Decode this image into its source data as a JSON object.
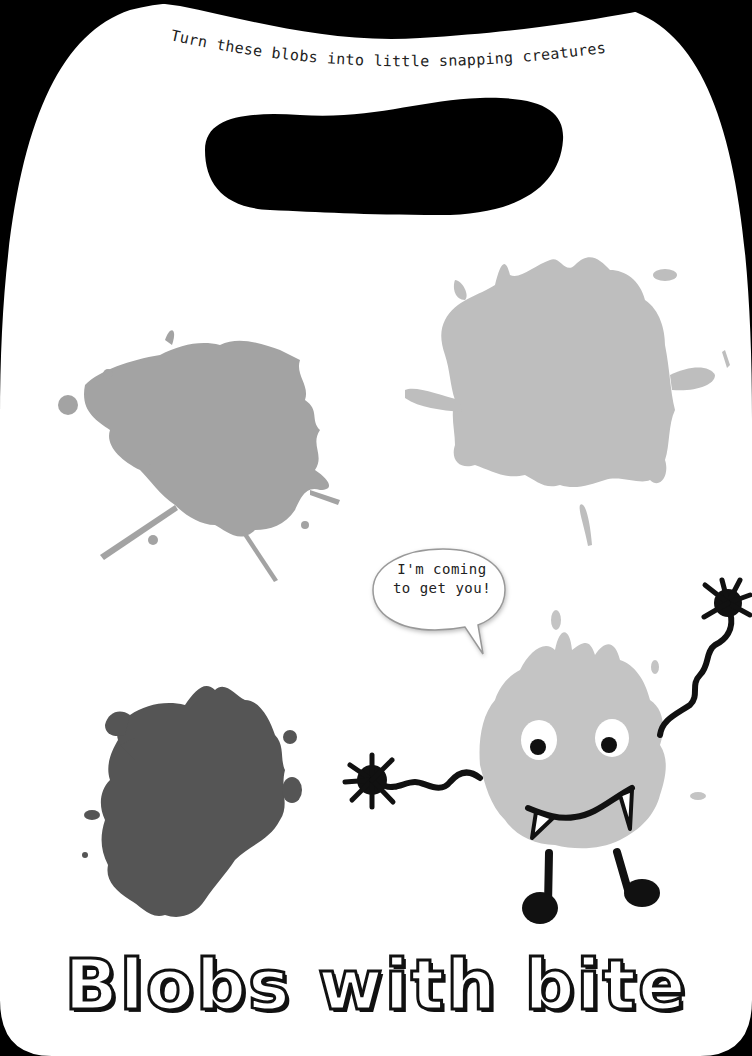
{
  "page": {
    "instruction": "Turn these blobs into little snapping creatures.",
    "speech_bubble": {
      "line1": "I'm coming",
      "line2": "to get you!"
    },
    "title": "Blobs with bite"
  },
  "colors": {
    "background_frame": "#000000",
    "card": "#ffffff",
    "blob_medium_gray": "#a3a3a3",
    "blob_light_gray": "#bebebe",
    "blob_dark_gray": "#555555",
    "monster_body": "#c4c4c4",
    "ink": "#111111"
  },
  "illustrations": [
    {
      "name": "medium-gray-blob"
    },
    {
      "name": "light-gray-blob"
    },
    {
      "name": "dark-gray-blob"
    },
    {
      "name": "monster-example"
    }
  ]
}
